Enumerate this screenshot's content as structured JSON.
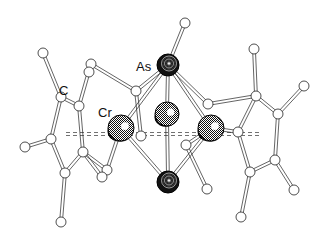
{
  "figure": {
    "type": "molecular-structure",
    "labels": [
      {
        "id": "as",
        "text": "As",
        "x": 136,
        "y": 60
      },
      {
        "id": "cr",
        "text": "Cr",
        "x": 98,
        "y": 106
      },
      {
        "id": "c",
        "text": "C",
        "x": 59,
        "y": 84
      }
    ]
  },
  "atoms": {
    "arsenic": [
      {
        "id": "As1",
        "x": 168,
        "y": 65,
        "r": 11
      },
      {
        "id": "As2",
        "x": 168,
        "y": 182,
        "r": 11
      }
    ],
    "chromium": [
      {
        "id": "Cr1",
        "x": 121,
        "y": 128,
        "r": 13
      },
      {
        "id": "Cr2",
        "x": 167,
        "y": 114,
        "r": 12
      },
      {
        "id": "Cr3",
        "x": 211,
        "y": 128,
        "r": 13
      }
    ],
    "carbon": [
      {
        "id": "C1",
        "x": 185,
        "y": 23
      },
      {
        "id": "C2",
        "x": 43,
        "y": 53
      },
      {
        "id": "C3",
        "x": 61,
        "y": 97
      },
      {
        "id": "C4",
        "x": 79,
        "y": 106
      },
      {
        "id": "C5",
        "x": 91,
        "y": 64
      },
      {
        "id": "C6",
        "x": 89,
        "y": 72
      },
      {
        "id": "C7",
        "x": 136,
        "y": 91
      },
      {
        "id": "C8",
        "x": 51,
        "y": 139
      },
      {
        "id": "C9",
        "x": 25,
        "y": 147
      },
      {
        "id": "C10",
        "x": 83,
        "y": 152
      },
      {
        "id": "C11",
        "x": 65,
        "y": 173
      },
      {
        "id": "C12",
        "x": 61,
        "y": 222
      },
      {
        "id": "C13",
        "x": 107,
        "y": 170
      },
      {
        "id": "C14",
        "x": 102,
        "y": 177
      },
      {
        "id": "C15",
        "x": 208,
        "y": 104
      },
      {
        "id": "C16",
        "x": 256,
        "y": 96
      },
      {
        "id": "C17",
        "x": 254,
        "y": 49
      },
      {
        "id": "C18",
        "x": 304,
        "y": 86
      },
      {
        "id": "C19",
        "x": 278,
        "y": 114
      },
      {
        "id": "C20",
        "x": 238,
        "y": 132
      },
      {
        "id": "C21",
        "x": 275,
        "y": 160
      },
      {
        "id": "C22",
        "x": 250,
        "y": 172
      },
      {
        "id": "C23",
        "x": 294,
        "y": 190
      },
      {
        "id": "C24",
        "x": 241,
        "y": 217
      },
      {
        "id": "C25",
        "x": 186,
        "y": 145
      },
      {
        "id": "C26",
        "x": 207,
        "y": 189
      },
      {
        "id": "C27",
        "x": 141,
        "y": 136
      }
    ]
  },
  "bonds": [
    [
      "As1",
      "C1"
    ],
    [
      "As1",
      "Cr1"
    ],
    [
      "As1",
      "Cr2"
    ],
    [
      "As1",
      "Cr3"
    ],
    [
      "As1",
      "C7"
    ],
    [
      "As1",
      "C15"
    ],
    [
      "As2",
      "Cr1"
    ],
    [
      "As2",
      "Cr2"
    ],
    [
      "As2",
      "Cr3"
    ],
    [
      "C2",
      "C3"
    ],
    [
      "C3",
      "C4"
    ],
    [
      "C3",
      "C8"
    ],
    [
      "C4",
      "C5"
    ],
    [
      "C4",
      "C10"
    ],
    [
      "C5",
      "C7"
    ],
    [
      "C7",
      "C27"
    ],
    [
      "C8",
      "C9"
    ],
    [
      "C8",
      "C11"
    ],
    [
      "C10",
      "C11"
    ],
    [
      "C10",
      "C13"
    ],
    [
      "C11",
      "C12"
    ],
    [
      "C13",
      "Cr1"
    ],
    [
      "C14",
      "C10"
    ],
    [
      "C15",
      "C16"
    ],
    [
      "C16",
      "C17"
    ],
    [
      "C16",
      "C19"
    ],
    [
      "C16",
      "C20"
    ],
    [
      "C19",
      "C18"
    ],
    [
      "C19",
      "C21"
    ],
    [
      "C20",
      "C22"
    ],
    [
      "C21",
      "C22"
    ],
    [
      "C21",
      "C23"
    ],
    [
      "C22",
      "C24"
    ],
    [
      "C20",
      "Cr3"
    ],
    [
      "C25",
      "C26"
    ],
    [
      "C25",
      "Cr3"
    ]
  ],
  "centroid_lines": [
    {
      "x1": 66,
      "y1": 134,
      "x2": 262,
      "y2": 134
    }
  ],
  "colors": {
    "atom_dark": "#111111",
    "bond": "#222222",
    "background": "#ffffff"
  }
}
